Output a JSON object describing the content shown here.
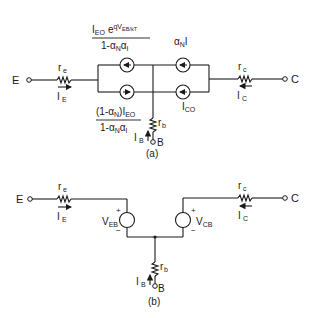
{
  "figure": {
    "panel_a": {
      "caption": "(a)",
      "terminals": {
        "emitter": "E",
        "collector": "C",
        "base": "B"
      },
      "resistors": {
        "emitter": "r",
        "emitter_sub": "e",
        "collector": "r",
        "collector_sub": "c",
        "base": "r",
        "base_sub": "b"
      },
      "currents": {
        "emitter": "I",
        "emitter_sub": "E",
        "collector": "I",
        "collector_sub": "C",
        "base": "I",
        "base_sub": "B"
      },
      "sources": {
        "top_left_num_main": "I",
        "top_left_num_sub": "EO",
        "top_left_num_exp": "e",
        "top_left_num_exp_sup": "qV",
        "top_left_num_exp_sup_sub": "EB/kT",
        "top_left_den": "1-α",
        "top_left_den_sub1": "N",
        "top_left_den_mid": "α",
        "top_left_den_sub2": "I",
        "bottom_left_num": "(1-α",
        "bottom_left_num_sub": "N",
        "bottom_left_num_tail": ")I",
        "bottom_left_num_tail_sub": "EO",
        "bottom_left_den": "1-α",
        "bottom_left_den_sub1": "N",
        "bottom_left_den_mid": "α",
        "bottom_left_den_sub2": "I",
        "top_right": "α",
        "top_right_sub": "N",
        "top_right_tail": "I",
        "bottom_right": "I",
        "bottom_right_sub": "CO"
      }
    },
    "panel_b": {
      "caption": "(b)",
      "terminals": {
        "emitter": "E",
        "collector": "C",
        "base": "B"
      },
      "resistors": {
        "emitter": "r",
        "emitter_sub": "e",
        "collector": "r",
        "collector_sub": "c",
        "base": "r",
        "base_sub": "b"
      },
      "currents": {
        "emitter": "I",
        "emitter_sub": "E",
        "collector": "I",
        "collector_sub": "C",
        "base": "I",
        "base_sub": "B"
      },
      "sources": {
        "veb": "V",
        "veb_sub": "EB",
        "vcb": "V",
        "vcb_sub": "CB",
        "plus": "+",
        "minus": "−"
      }
    }
  }
}
